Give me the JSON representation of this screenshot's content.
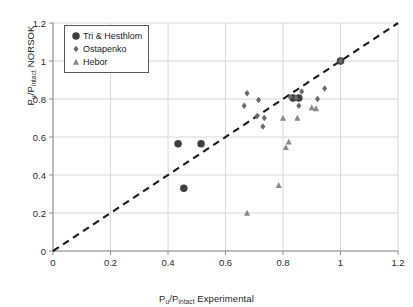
{
  "chart_data": {
    "type": "scatter",
    "title": "",
    "xlabel": "Pu/Pintact Experimental",
    "ylabel": "Pu/Pintact NORSOK",
    "xlabel_parts": {
      "lead": "P",
      "lead_sub": "u",
      "mid": "/P",
      "mid_sub": "intact",
      "tail": " Experimental"
    },
    "ylabel_parts": {
      "lead": "P",
      "lead_sub": "u",
      "mid": "/P",
      "mid_sub": "intact",
      "tail": " NORSOK"
    },
    "xlim": [
      0,
      1.2
    ],
    "ylim": [
      0,
      1.2
    ],
    "xticks": [
      "0",
      "0.2",
      "0.4",
      "0.6",
      "0.8",
      "1",
      "1.2"
    ],
    "yticks": [
      "0",
      "0.2",
      "0.4",
      "0.6",
      "0.8",
      "1",
      "1.2"
    ],
    "xtick_values": [
      0,
      0.2,
      0.4,
      0.6,
      0.8,
      1.0,
      1.2
    ],
    "ytick_values": [
      0,
      0.2,
      0.4,
      0.6,
      0.8,
      1.0,
      1.2
    ],
    "grid": true,
    "grid_color": "#d8d8d8",
    "axis_color": "#8c8c8c",
    "legend_position": "upper left",
    "reference_line": {
      "label": "1:1 parity line",
      "style": "dashed",
      "color": "#1a1a1a",
      "x": [
        0,
        1.2
      ],
      "y": [
        0,
        1.2
      ]
    },
    "series": [
      {
        "name": "Tri & Hesthlom",
        "marker": "circle",
        "color": "#3f3f3f",
        "size": 7.5,
        "points": [
          {
            "x": 0.435,
            "y": 0.565
          },
          {
            "x": 0.515,
            "y": 0.565
          },
          {
            "x": 0.455,
            "y": 0.33
          },
          {
            "x": 0.835,
            "y": 0.805
          },
          {
            "x": 0.855,
            "y": 0.805
          },
          {
            "x": 1.0,
            "y": 1.0
          }
        ]
      },
      {
        "name": "Ostapenko",
        "marker": "diamond",
        "color": "#6a6a6a",
        "size": 6.5,
        "points": [
          {
            "x": 0.665,
            "y": 0.765
          },
          {
            "x": 0.675,
            "y": 0.83
          },
          {
            "x": 0.715,
            "y": 0.795
          },
          {
            "x": 0.71,
            "y": 0.71
          },
          {
            "x": 0.735,
            "y": 0.7
          },
          {
            "x": 0.73,
            "y": 0.655
          },
          {
            "x": 0.825,
            "y": 0.81
          },
          {
            "x": 0.845,
            "y": 0.805
          },
          {
            "x": 0.855,
            "y": 0.765
          },
          {
            "x": 0.865,
            "y": 0.84
          },
          {
            "x": 0.945,
            "y": 0.855
          },
          {
            "x": 0.92,
            "y": 0.8
          },
          {
            "x": 1.0,
            "y": 1.0
          }
        ]
      },
      {
        "name": "Hebor",
        "marker": "triangle",
        "color": "#8a8a8a",
        "size": 6.5,
        "points": [
          {
            "x": 0.675,
            "y": 0.2
          },
          {
            "x": 0.785,
            "y": 0.345
          },
          {
            "x": 0.81,
            "y": 0.545
          },
          {
            "x": 0.82,
            "y": 0.575
          },
          {
            "x": 0.8,
            "y": 0.7
          },
          {
            "x": 0.85,
            "y": 0.7
          },
          {
            "x": 0.9,
            "y": 0.755
          },
          {
            "x": 0.915,
            "y": 0.75
          }
        ]
      }
    ]
  },
  "legend": {
    "items": [
      {
        "label": "Tri & Hesthlom",
        "marker": "circle"
      },
      {
        "label": "Ostapenko",
        "marker": "diamond"
      },
      {
        "label": "Hebor",
        "marker": "triangle"
      }
    ]
  }
}
